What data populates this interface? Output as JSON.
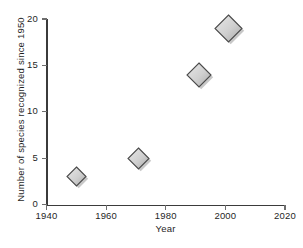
{
  "chart_data": {
    "type": "scatter",
    "title": "",
    "xlabel": "Year",
    "ylabel": "Number of species recognized since 1950",
    "xlim": [
      1940,
      2020
    ],
    "ylim": [
      0,
      20
    ],
    "xticks": [
      1940,
      1960,
      1980,
      2000,
      2020
    ],
    "yticks": [
      0,
      5,
      10,
      15,
      20
    ],
    "xtick_labels": [
      "1940",
      "1960",
      "1980",
      "2000",
      "2020"
    ],
    "ytick_labels": [
      "0",
      "5",
      "10",
      "15",
      "20"
    ],
    "grid": false,
    "legend": false,
    "marker_shape": "diamond",
    "marker_color": "#c9c9c9",
    "marker_edge_color": "#4a4a4a",
    "points": [
      {
        "x": 1950,
        "y": 3,
        "label": "1950, 3",
        "size": 19
      },
      {
        "x": 1971,
        "y": 5,
        "label": "1971, 5",
        "size": 21
      },
      {
        "x": 1991,
        "y": 14,
        "label": "1991, 14",
        "size": 24
      },
      {
        "x": 2001,
        "y": 19,
        "label": "2001, 19",
        "size": 27
      }
    ]
  },
  "axes": {
    "x_title": "Year",
    "y_title": "Number of species recognized since 1950"
  },
  "colors": {
    "background": "#ffffff",
    "axis": "#3b3b3b",
    "tick": "#6e6e6e",
    "text": "#1f1f1f",
    "marker_fill_light": "#e8e8e8",
    "marker_fill_dark": "#a8a8a8",
    "marker_edge": "#4a4a4a",
    "marker_shadow": "#b5b5b5"
  }
}
